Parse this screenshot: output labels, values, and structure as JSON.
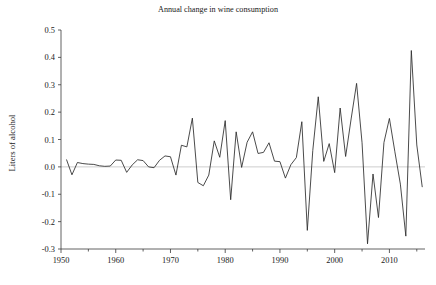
{
  "chart_data": {
    "type": "line",
    "title": "Annual change in wine consumption",
    "xlabel": "",
    "ylabel": "Liters of alcohol",
    "xlim": [
      1950,
      2016.5
    ],
    "ylim": [
      -0.3,
      0.5
    ],
    "grid": false,
    "legend": null,
    "zero_reference_line": 0.0,
    "x_ticks_major": [
      1950,
      1960,
      1970,
      1980,
      1990,
      2000,
      2010
    ],
    "x_tick_labels": [
      "1950",
      "1960",
      "1970",
      "1980",
      "1990",
      "2000",
      "2010"
    ],
    "x_ticks_minor": [
      1955,
      1965,
      1975,
      1985,
      1995,
      2005,
      2015
    ],
    "y_ticks": [
      -0.3,
      -0.2,
      -0.1,
      0.0,
      0.1,
      0.2,
      0.3,
      0.4,
      0.5
    ],
    "y_tick_labels": [
      "-0.3",
      "-0.2",
      "-0.1",
      "0.0",
      "0.1",
      "0.2",
      "0.3",
      "0.4",
      "0.5"
    ],
    "line_color": "#2b2b2b",
    "series": [
      {
        "name": "Annual change in wine consumption",
        "x": [
          1951,
          1952,
          1953,
          1954,
          1955,
          1956,
          1957,
          1958,
          1959,
          1960,
          1961,
          1962,
          1963,
          1964,
          1965,
          1966,
          1967,
          1968,
          1969,
          1970,
          1971,
          1972,
          1973,
          1974,
          1975,
          1976,
          1977,
          1978,
          1979,
          1980,
          1981,
          1982,
          1983,
          1984,
          1985,
          1986,
          1987,
          1988,
          1989,
          1990,
          1991,
          1992,
          1993,
          1994,
          1995,
          1996,
          1997,
          1998,
          1999,
          2000,
          2001,
          2002,
          2003,
          2004,
          2005,
          2006,
          2007,
          2008,
          2009,
          2010,
          2011,
          2012,
          2013,
          2014,
          2015,
          2016
        ],
        "values": [
          0.027,
          -0.029,
          0.016,
          0.012,
          0.01,
          0.009,
          0.004,
          0.002,
          0.003,
          0.025,
          0.024,
          -0.02,
          0.007,
          0.026,
          0.023,
          0.0,
          -0.003,
          0.024,
          0.04,
          0.037,
          -0.03,
          0.079,
          0.073,
          0.178,
          -0.057,
          -0.069,
          -0.03,
          0.095,
          0.035,
          0.169,
          -0.12,
          0.128,
          -0.002,
          0.09,
          0.128,
          0.049,
          0.053,
          0.088,
          0.021,
          0.019,
          -0.041,
          0.008,
          0.034,
          0.165,
          -0.232,
          0.06,
          0.256,
          0.02,
          0.085,
          -0.021,
          0.215,
          0.038,
          0.175,
          0.305,
          0.088,
          -0.281,
          -0.026,
          -0.185,
          0.089,
          0.177,
          0.055,
          -0.063,
          -0.253,
          0.425,
          0.08,
          -0.074
        ]
      }
    ]
  }
}
